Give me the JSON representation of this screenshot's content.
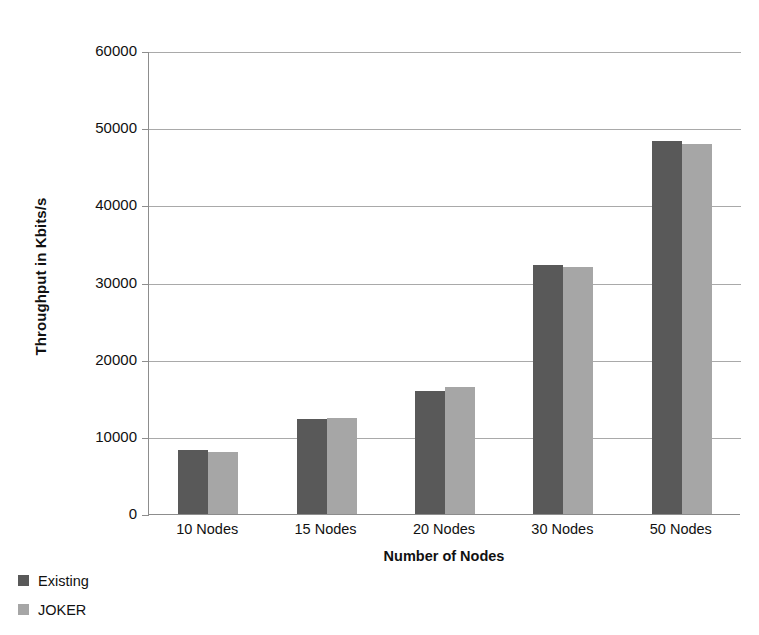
{
  "chart_data": {
    "type": "bar",
    "title": "",
    "xlabel": "Number of Nodes",
    "ylabel": "Throughput in Kbits/s",
    "categories": [
      "10 Nodes",
      "15 Nodes",
      "20 Nodes",
      "30 Nodes",
      "50 Nodes"
    ],
    "series": [
      {
        "name": "Existing",
        "color": "#595959",
        "values": [
          8300,
          12300,
          16000,
          32300,
          48300
        ]
      },
      {
        "name": "JOKER",
        "color": "#a6a6a6",
        "values": [
          8000,
          12500,
          16500,
          32000,
          48000
        ]
      }
    ],
    "ylim": [
      0,
      60000
    ],
    "ytick_labels": [
      "60000",
      "50000",
      "40000",
      "30000",
      "20000",
      "10000",
      "0"
    ],
    "ytick_values": [
      60000,
      50000,
      40000,
      30000,
      20000,
      10000,
      0
    ],
    "grid": true,
    "legend_position": "bottom-left"
  },
  "axis": {
    "y_title": "Throughput in Kbits/s",
    "x_title": "Number of Nodes"
  },
  "legend": {
    "items": [
      {
        "label": "Existing",
        "color": "#595959"
      },
      {
        "label": "JOKER",
        "color": "#a6a6a6"
      }
    ]
  }
}
